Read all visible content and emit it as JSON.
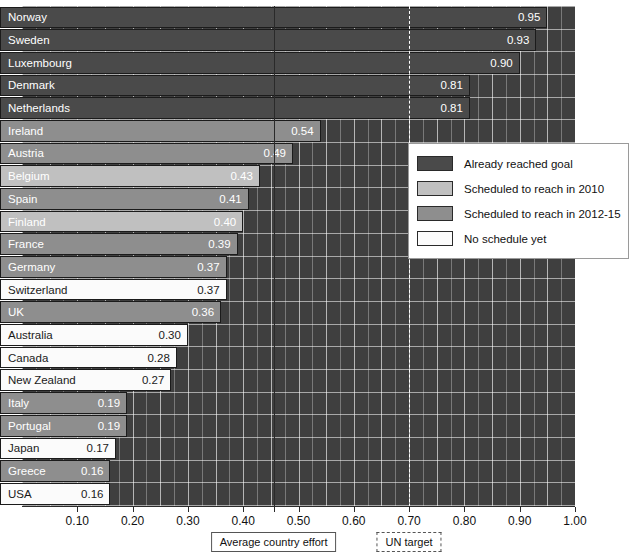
{
  "chart_data": {
    "type": "bar",
    "orientation": "horizontal",
    "title": "",
    "xlabel": "",
    "ylabel": "",
    "xlim": [
      0.0,
      1.0
    ],
    "grid": true,
    "legend_position": "right",
    "categories": [
      "Norway",
      "Sweden",
      "Luxembourg",
      "Denmark",
      "Netherlands",
      "Ireland",
      "Austria",
      "Belgium",
      "Spain",
      "Finland",
      "France",
      "Germany",
      "Switzerland",
      "UK",
      "Australia",
      "Canada",
      "New Zealand",
      "Italy",
      "Portugal",
      "Japan",
      "Greece",
      "USA"
    ],
    "values": [
      0.95,
      0.93,
      0.9,
      0.81,
      0.81,
      0.54,
      0.49,
      0.43,
      0.41,
      0.4,
      0.39,
      0.37,
      0.37,
      0.36,
      0.3,
      0.28,
      0.27,
      0.19,
      0.19,
      0.17,
      0.16,
      0.16
    ],
    "value_labels": [
      "0.95",
      "0.93",
      "0.90",
      "0.81",
      "0.81",
      "0.54",
      "0.49",
      "0.43",
      "0.41",
      "0.40",
      "0.39",
      "0.37",
      "0.37",
      "0.36",
      "0.30",
      "0.28",
      "0.27",
      "0.19",
      "0.19",
      "0.17",
      "0.16",
      "0.16"
    ],
    "groups": [
      "reached",
      "reached",
      "reached",
      "reached",
      "reached",
      "sched2012",
      "sched2012",
      "sched2010",
      "sched2012",
      "sched2010",
      "sched2012",
      "sched2012",
      "none",
      "sched2012",
      "none",
      "none",
      "none",
      "sched2012",
      "sched2012",
      "none",
      "sched2012",
      "none"
    ],
    "tick_labels": [
      "0.10",
      "0.20",
      "0.30",
      "0.40",
      "0.50",
      "0.60",
      "0.70",
      "0.80",
      "0.90",
      "1.00"
    ],
    "tick_values": [
      0.1,
      0.2,
      0.3,
      0.4,
      0.5,
      0.6,
      0.7,
      0.8,
      0.9,
      1.0
    ],
    "annotations": [
      {
        "label": "Average country effort",
        "value": 0.455,
        "style": "solid"
      },
      {
        "label": "UN target",
        "value": 0.7,
        "style": "bracket"
      }
    ],
    "legend": [
      {
        "label": "Already reached goal",
        "group": "reached",
        "color": "#4a4a4a"
      },
      {
        "label": "Scheduled to reach in 2010",
        "group": "sched2010",
        "color": "#c0c0c0"
      },
      {
        "label": "Scheduled to reach in 2012-15",
        "group": "sched2012",
        "color": "#8e8e8e"
      },
      {
        "label": "No schedule yet",
        "group": "none",
        "color": "#fbfbfb"
      }
    ],
    "colors": {
      "plot_background": "#3f3f3f",
      "gridline": "#ffffff",
      "axis": "#2b2b2b",
      "reached": "#4a4a4a",
      "sched2010": "#c0c0c0",
      "sched2012": "#8e8e8e",
      "none": "#fbfbfb"
    }
  }
}
